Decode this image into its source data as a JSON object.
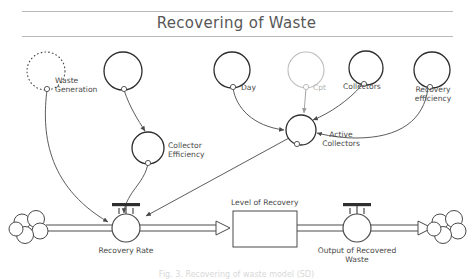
{
  "header": {
    "title": "Recovering of Waste"
  },
  "caption": {
    "text": "Fig. 3. Recovering of waste model (SD)"
  },
  "diagram": {
    "type": "system-dynamics-stock-and-flow",
    "variables": [
      {
        "id": "waste-generation",
        "label": "Waste\nGeneration",
        "kind": "auxiliary-ghost",
        "style": "dotted",
        "cx": 46,
        "cy": 71,
        "r": 19
      },
      {
        "id": "unnamed-upper-left",
        "label": "",
        "kind": "auxiliary",
        "style": "solid",
        "cx": 123,
        "cy": 71,
        "r": 19
      },
      {
        "id": "collector-efficiency",
        "label": "Collector\nEfficiency",
        "kind": "auxiliary",
        "style": "solid",
        "cx": 148,
        "cy": 148,
        "r": 16
      },
      {
        "id": "day",
        "label": "Day",
        "kind": "auxiliary",
        "style": "solid",
        "cx": 232,
        "cy": 70,
        "r": 18
      },
      {
        "id": "cpt",
        "label": "Cpt",
        "kind": "auxiliary",
        "style": "solid-muted",
        "cx": 306,
        "cy": 70,
        "r": 18
      },
      {
        "id": "collectors",
        "label": "Collectors",
        "kind": "auxiliary",
        "style": "solid",
        "cx": 366,
        "cy": 68,
        "r": 17
      },
      {
        "id": "recovery-efficiency",
        "label": "Recovery\nefficiency",
        "kind": "auxiliary",
        "style": "solid",
        "cx": 432,
        "cy": 70,
        "r": 18
      },
      {
        "id": "active-collectors",
        "label": "Active\nCollectors",
        "kind": "auxiliary",
        "style": "solid",
        "cx": 301,
        "cy": 130,
        "r": 15
      }
    ],
    "stocks": [
      {
        "id": "level-of-recovery",
        "label": "Level of Recovery",
        "x": 233,
        "y": 216,
        "w": 64,
        "h": 35
      }
    ],
    "flows": [
      {
        "id": "recovery-rate",
        "label": "Recovery Rate",
        "cx": 126,
        "cy": 228,
        "r": 14
      },
      {
        "id": "output-of-recovered-waste",
        "label": "Output of Recovered\nWaste",
        "cx": 357,
        "cy": 228,
        "r": 14
      }
    ],
    "clouds": [
      {
        "id": "source-cloud",
        "cx": 31,
        "cy": 228
      },
      {
        "id": "sink-cloud",
        "cx": 447,
        "cy": 228
      }
    ],
    "links": [
      {
        "from": "waste-generation",
        "to": "recovery-rate"
      },
      {
        "from": "unnamed-upper-left",
        "to": "collector-efficiency"
      },
      {
        "from": "collector-efficiency",
        "to": "recovery-rate"
      },
      {
        "from": "day",
        "to": "active-collectors"
      },
      {
        "from": "cpt",
        "to": "active-collectors"
      },
      {
        "from": "collectors",
        "to": "active-collectors"
      },
      {
        "from": "recovery-efficiency",
        "to": "active-collectors"
      },
      {
        "from": "active-collectors",
        "to": "recovery-rate"
      }
    ],
    "colors": {
      "line": "#4a4a4a",
      "muted": "#c2c2c2",
      "text": "#4a4a4a",
      "rule": "#b9b9b9",
      "title": "#575757"
    }
  }
}
